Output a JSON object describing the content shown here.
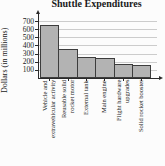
{
  "figure": {
    "title": "Shuttle Expenditures",
    "ylabel": "Dollars (in millions)"
  },
  "chart_data": {
    "type": "bar",
    "title": "Shuttle Expenditures",
    "xlabel": "",
    "ylabel": "Dollars (in millions)",
    "categories": [
      "Vehicle and extravehicular activity",
      "Reusable solid rocket motor",
      "External tank",
      "Main engine",
      "Flight hardware upgrades",
      "Solid rocket booster"
    ],
    "category_lines": [
      [
        "Vehicle and",
        "extravehicular activity"
      ],
      [
        "Reusable solid",
        "rocket motor"
      ],
      [
        "External tank"
      ],
      [
        "Main engine"
      ],
      [
        "Flight hardware",
        "upgrades"
      ],
      [
        "Solid rocket booster"
      ]
    ],
    "values": [
      650,
      360,
      260,
      245,
      175,
      165
    ],
    "ylim": [
      0,
      700
    ],
    "yticks": [
      100,
      200,
      300,
      400,
      500,
      600,
      700
    ],
    "grid": true,
    "legend": "none",
    "colors": {
      "bar_fill": "#b3b3b3",
      "bar_border": "#3d3d3d",
      "gridline": "#cccccc",
      "axis": "#2a2a2a",
      "text": "#1a1a1a",
      "background": "#fcfcfc"
    }
  }
}
